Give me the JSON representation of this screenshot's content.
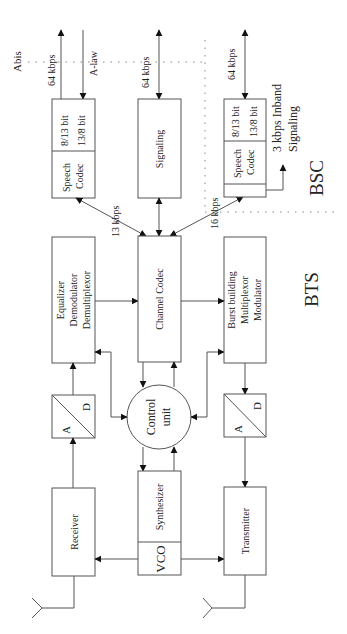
{
  "diagram": {
    "type": "block-diagram",
    "orientation": "rotated-90-ccw",
    "regions": {
      "bsc_label": "BSC",
      "bts_label": "BTS",
      "interface_label": "Abis"
    },
    "blocks": {
      "speech_codec_bts": {
        "name": "Speech\nCodec",
        "line1": "Speech",
        "line2": "Codec",
        "sub1": "8/13 bit",
        "sub2": "13/8 bit"
      },
      "signaling": {
        "label": "Signaling"
      },
      "speech_codec_bsc": {
        "line1": "Speech",
        "line2": "Codec",
        "sub1": "8/13 bit",
        "sub2": "13/8 bit"
      },
      "equalizer": {
        "line1": "Equalizer",
        "line2": "Demodulator",
        "line3": "Demultiplexor"
      },
      "channel_codec": {
        "label": "Channel Codec"
      },
      "burst_building": {
        "line1": "Burst building",
        "line2": "Multiplexor",
        "line3": "Modulator"
      },
      "ad_rx": {
        "a": "A",
        "d": "D"
      },
      "control_unit": {
        "line1": "Control",
        "line2": "unit"
      },
      "ad_tx": {
        "a": "A",
        "d": "D"
      },
      "receiver": {
        "label": "Receiver"
      },
      "synthesizer": {
        "label": "Synthesizer",
        "vco": "VCO"
      },
      "transmitter": {
        "label": "Transmitter"
      }
    },
    "rates": {
      "speech_64": "64 kbps",
      "alaw": "A-law",
      "signaling_64": "64 kbps",
      "bsc_64": "64 kbps",
      "r13": "13 kbps",
      "r16": "16 kbps",
      "inband_line1": "3 kbps Inband",
      "inband_line2": "Signaling"
    }
  }
}
